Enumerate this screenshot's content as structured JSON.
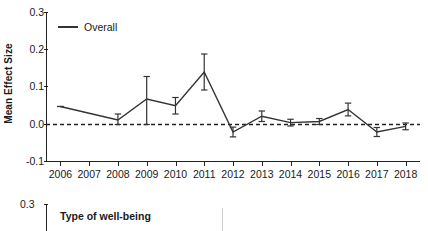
{
  "figure": {
    "panels": [
      {
        "id": "overall-trend",
        "ylabel": "Mean Effect Size",
        "legend_label": "Overall"
      },
      {
        "id": "type-of-wellbeing",
        "legend_title": "Type of well-being",
        "legend_items": [
          "Negative indicators"
        ],
        "y_top_tick": "0.3"
      }
    ]
  },
  "chart_data": {
    "type": "line",
    "title": "",
    "xlabel": "",
    "ylabel": "Mean Effect Size",
    "xlim": [
      2005.5,
      2018.5
    ],
    "ylim": [
      -0.1,
      0.3
    ],
    "yticks": [
      0.3,
      0.2,
      0.1,
      0.0,
      -0.1
    ],
    "ytick_labels": [
      "0.3",
      "0.2",
      "0.1",
      "0.0",
      "-0.1"
    ],
    "categories": [
      2006,
      2007,
      2008,
      2009,
      2010,
      2011,
      2012,
      2013,
      2014,
      2015,
      2016,
      2017,
      2018
    ],
    "xtick_labels": [
      "2006",
      "2007",
      "2008",
      "2009",
      "2010",
      "2011",
      "2012",
      "2013",
      "2014",
      "2015",
      "2016",
      "2017",
      "2018"
    ],
    "grid": false,
    "legend_position": "upper left",
    "reference_line": {
      "y": 0.0,
      "style": "dashed"
    },
    "errorbars": true,
    "series": [
      {
        "name": "Overall",
        "color": "#333333",
        "values": [
          0.048,
          0.03,
          0.012,
          0.068,
          0.05,
          0.14,
          -0.02,
          0.022,
          0.005,
          0.008,
          0.04,
          -0.02,
          -0.005
        ],
        "err_low": [
          0.048,
          0.03,
          0.0,
          0.0,
          0.028,
          0.092,
          -0.033,
          0.008,
          -0.004,
          0.0,
          0.023,
          -0.032,
          -0.014
        ],
        "err_high": [
          0.048,
          0.03,
          0.028,
          0.128,
          0.072,
          0.188,
          -0.007,
          0.036,
          0.014,
          0.016,
          0.057,
          -0.008,
          0.004
        ],
        "points_with_errorbars": [
          2006,
          2008,
          2009,
          2010,
          2011,
          2012,
          2013,
          2014,
          2015,
          2016,
          2017,
          2018
        ]
      }
    ]
  }
}
